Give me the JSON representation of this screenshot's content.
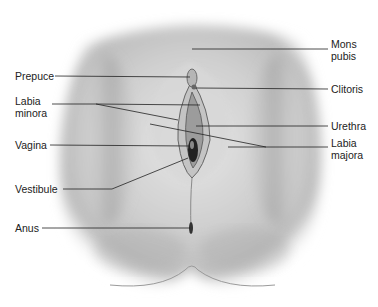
{
  "diagram": {
    "type": "anatomical-illustration",
    "style": "grayscale pencil shading",
    "labels": {
      "mons_pubis": {
        "line1": "Mons",
        "line2": "pubis"
      },
      "prepuce": "Prepuce",
      "clitoris": "Clitoris",
      "labia_minora": {
        "line1": "Labia",
        "line2": "minora"
      },
      "urethra": "Urethra",
      "vagina": "Vagina",
      "labia_majora": {
        "line1": "Labia",
        "line2": "majora"
      },
      "vestibule": "Vestibule",
      "anus": "Anus"
    }
  }
}
